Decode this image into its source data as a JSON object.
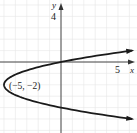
{
  "chart_data": {
    "type": "line",
    "title": "",
    "xlabel": "x",
    "ylabel": "y",
    "x_tick_labels": [
      {
        "value": 5,
        "label": "5"
      }
    ],
    "y_tick_labels": [
      {
        "value": 4,
        "label": "4"
      }
    ],
    "xlim": [
      -5.3,
      6.6
    ],
    "ylim": [
      -6.2,
      5.4
    ],
    "grid": true,
    "grid_step": 1,
    "series": [
      {
        "name": "parabola",
        "equation": "x = 1.25(y + 2)^2 - 5",
        "vertex": [
          -5,
          -2
        ],
        "direction": "opens right",
        "arrows_at_ends": true,
        "y_range": [
          -5,
          1
        ]
      }
    ],
    "annotations": [
      {
        "text": "(−5, −2)",
        "at": [
          -5,
          -2
        ]
      }
    ]
  },
  "labels": {
    "x_axis": "x",
    "y_axis": "y",
    "x_tick": "5",
    "y_tick": "4",
    "vertex_label": "(−5, −2)"
  },
  "colors": {
    "curve": "#1a1a1a",
    "axes": "#333333",
    "grid": "#e6e6e6",
    "text": "#222222"
  }
}
